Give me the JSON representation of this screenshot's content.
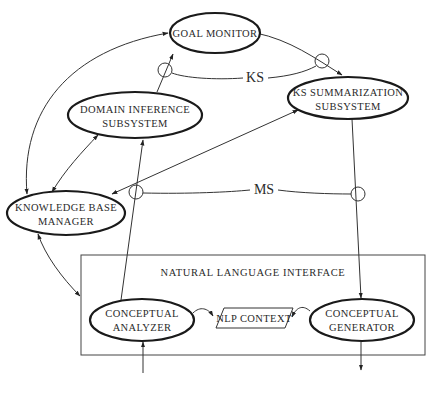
{
  "diagram": {
    "nodes": {
      "goal_monitor": {
        "lines": [
          "GOAL MONITOR"
        ]
      },
      "domain_inference": {
        "lines": [
          "DOMAIN INFERENCE",
          "SUBSYSTEM"
        ]
      },
      "ks_summarization": {
        "lines": [
          "KS SUMMARIZATION",
          "SUBSYSTEM"
        ]
      },
      "knowledge_base": {
        "lines": [
          "KNOWLEDGE BASE",
          "MANAGER"
        ]
      },
      "conceptual_analyzer": {
        "lines": [
          "CONCEPTUAL",
          "ANALYZER"
        ]
      },
      "nlp_context": {
        "lines": [
          "NLP CONTEXT"
        ]
      },
      "conceptual_generator": {
        "lines": [
          "CONCEPTUAL",
          "GENERATOR"
        ]
      }
    },
    "group": {
      "title": "NATURAL LANGUAGE INTERFACE"
    },
    "channels": {
      "ks": "KS",
      "ms": "MS"
    },
    "colors": {
      "stroke": "#1a1a1a",
      "background": "#ffffff"
    }
  }
}
